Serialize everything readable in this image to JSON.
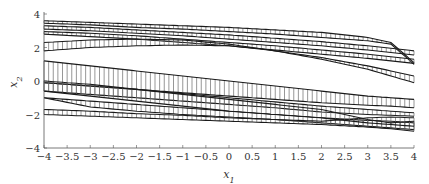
{
  "chart_data": {
    "type": "line",
    "title": "",
    "xlabel": "x_1",
    "ylabel": "x_2",
    "xlim": [
      -4,
      4
    ],
    "ylim": [
      -4,
      4
    ],
    "xticks": [
      -4,
      -3.5,
      -3,
      -2.5,
      -2,
      -1.5,
      -1,
      -0.5,
      0,
      0.5,
      1,
      1.5,
      2,
      2.5,
      3,
      3.5,
      4
    ],
    "xtick_labels": [
      "−4",
      "−3.5",
      "−3",
      "−2.5",
      "−2",
      "−1.5",
      "−1",
      "−0.5",
      "0",
      "0.5",
      "1",
      "1.5",
      "2",
      "2.5",
      "3",
      "3.5",
      "4"
    ],
    "yticks": [
      -4,
      -2,
      0,
      2,
      4
    ],
    "ytick_labels": [
      "−4",
      "−2",
      "0",
      "2",
      "4"
    ],
    "grid": false,
    "legend": null,
    "x": [
      -4,
      -3,
      -2,
      -1,
      0,
      1,
      2,
      3,
      3.5,
      4
    ],
    "series": [
      {
        "name": "band1_upper",
        "values": [
          3.6,
          3.5,
          3.4,
          3.3,
          3.2,
          3.05,
          2.9,
          2.6,
          2.3,
          1.1
        ]
      },
      {
        "name": "band1_lower",
        "values": [
          3.45,
          3.35,
          3.2,
          3.1,
          2.95,
          2.8,
          2.6,
          2.4,
          2.2,
          1.0
        ]
      },
      {
        "name": "band2_upper",
        "values": [
          3.3,
          3.2,
          3.05,
          2.9,
          2.75,
          2.55,
          2.35,
          2.1,
          1.95,
          1.8
        ]
      },
      {
        "name": "band2_lower",
        "values": [
          3.1,
          3.0,
          2.85,
          2.7,
          2.5,
          2.3,
          2.1,
          1.85,
          1.7,
          1.55
        ]
      },
      {
        "name": "band3_upper",
        "values": [
          2.95,
          2.85,
          2.7,
          2.5,
          2.3,
          2.1,
          1.85,
          1.6,
          1.45,
          1.3
        ]
      },
      {
        "name": "band3_lower",
        "values": [
          2.8,
          2.65,
          2.5,
          2.3,
          2.1,
          1.85,
          1.6,
          1.35,
          1.2,
          1.05
        ]
      },
      {
        "name": "band4_upper",
        "values": [
          2.3,
          2.45,
          2.5,
          2.45,
          2.2,
          1.8,
          1.3,
          0.7,
          0.3,
          -0.1
        ]
      },
      {
        "name": "band4_lower",
        "values": [
          1.8,
          2.0,
          2.1,
          2.15,
          2.1,
          1.8,
          1.4,
          0.9,
          0.6,
          0.3
        ]
      },
      {
        "name": "band5_upper",
        "values": [
          1.2,
          0.9,
          0.6,
          0.3,
          0.0,
          -0.3,
          -0.6,
          -0.9,
          -1.0,
          -1.1
        ]
      },
      {
        "name": "band5_lower",
        "values": [
          -0.1,
          -0.3,
          -0.5,
          -0.7,
          -0.9,
          -1.1,
          -1.3,
          -1.45,
          -1.5,
          -1.6
        ]
      },
      {
        "name": "band6_upper",
        "values": [
          -0.1,
          -0.3,
          -0.5,
          -0.75,
          -1.0,
          -1.25,
          -1.5,
          -1.7,
          -1.8,
          -1.9
        ]
      },
      {
        "name": "band6_lower",
        "values": [
          -0.6,
          -0.8,
          -1.0,
          -1.2,
          -1.4,
          -1.6,
          -1.85,
          -2.0,
          -2.05,
          -2.1
        ]
      },
      {
        "name": "band7_upper",
        "values": [
          -1.0,
          -1.2,
          -1.4,
          -1.6,
          -1.8,
          -2.0,
          -2.2,
          -2.35,
          -2.4,
          -2.5
        ]
      },
      {
        "name": "band7_lower",
        "values": [
          -1.0,
          -1.55,
          -1.8,
          -2.0,
          -2.15,
          -2.3,
          -2.5,
          -2.7,
          -2.8,
          -2.9
        ]
      },
      {
        "name": "band8_upper",
        "values": [
          -1.7,
          -1.8,
          -1.95,
          -2.05,
          -2.2,
          -2.3,
          -2.4,
          -2.2,
          -2.15,
          -2.2
        ]
      },
      {
        "name": "band8_lower",
        "values": [
          -2.0,
          -2.1,
          -2.2,
          -2.3,
          -2.4,
          -2.5,
          -2.6,
          -2.75,
          -2.85,
          -3.0
        ]
      },
      {
        "name": "band9_upper",
        "values": [
          0.0,
          -0.2,
          -0.5,
          -0.8,
          -1.1,
          -1.4,
          -1.7,
          -2.3,
          -2.5,
          -2.4
        ]
      },
      {
        "name": "band9_lower",
        "values": [
          -0.6,
          -0.9,
          -1.2,
          -1.5,
          -1.8,
          -2.0,
          -2.2,
          -2.5,
          -2.6,
          -2.7
        ]
      }
    ]
  }
}
